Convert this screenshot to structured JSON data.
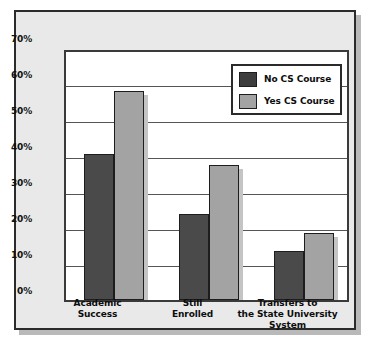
{
  "chart_data": {
    "type": "bar",
    "title": "",
    "xlabel": "",
    "ylabel": "",
    "ylim": [
      0,
      70
    ],
    "grid": true,
    "legend_position": "top-right",
    "categories": [
      "Academic Success",
      "Still Enrolled",
      "Transfers to the State University System"
    ],
    "category_lines": [
      [
        "Academic",
        "Success"
      ],
      [
        "Still",
        "Enrolled"
      ],
      [
        "Transfers to",
        "the State University",
        "System"
      ]
    ],
    "series": [
      {
        "name": "No CS Course",
        "color": "#4a4a4a",
        "values": [
          40.5,
          24.0,
          13.5
        ]
      },
      {
        "name": "Yes CS Course",
        "color": "#a3a3a3",
        "values": [
          58.0,
          37.5,
          18.5
        ]
      }
    ],
    "yticks": [
      "0%",
      "10%",
      "20%",
      "30%",
      "40%",
      "50%",
      "60%",
      "70%"
    ],
    "ytick_values": [
      0,
      10,
      20,
      30,
      40,
      50,
      60,
      70
    ]
  }
}
